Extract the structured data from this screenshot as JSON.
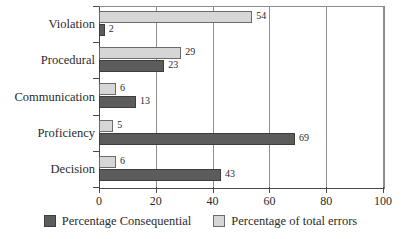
{
  "chart_data": {
    "type": "bar",
    "orientation": "horizontal",
    "title": "",
    "xlabel": "",
    "ylabel": "",
    "xlim": [
      0,
      100
    ],
    "xticks": [
      0,
      20,
      40,
      60,
      80,
      100
    ],
    "xtick_labels": [
      "0",
      "20",
      "40",
      "60",
      "80",
      "100"
    ],
    "grid": true,
    "grid_axis": "x",
    "legend_position": "bottom",
    "categories": [
      "Violation",
      "Procedural",
      "Communication",
      "Proficiency",
      "Decision"
    ],
    "series": [
      {
        "name": "Percentage Consequential",
        "color": "#5c5c5c",
        "values": [
          2,
          23,
          13,
          69,
          43
        ]
      },
      {
        "name": "Percentage of total errors",
        "color": "#d6d6d6",
        "values": [
          54,
          29,
          6,
          5,
          6
        ]
      }
    ]
  },
  "legend": {
    "items": [
      {
        "label": "Percentage Consequential",
        "swatch": "dark"
      },
      {
        "label": "Percentage of total errors",
        "swatch": "light"
      }
    ]
  }
}
